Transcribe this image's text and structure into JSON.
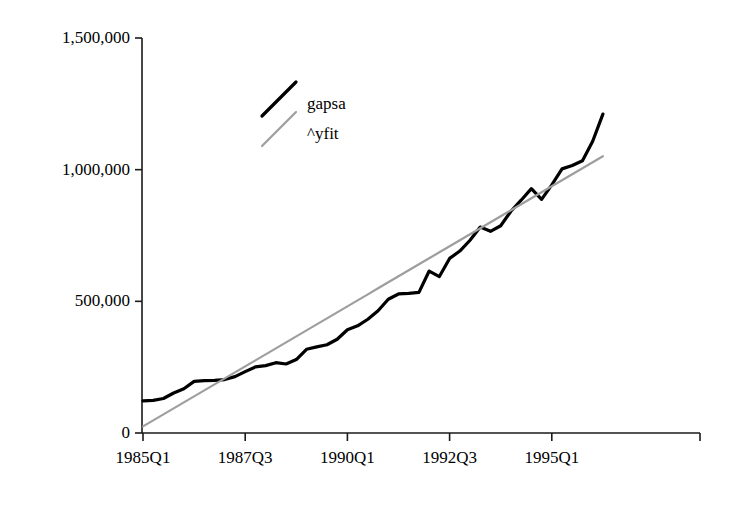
{
  "chart_data": {
    "type": "line",
    "title": "",
    "subtitle": "",
    "xlabel": "",
    "ylabel": "",
    "grid": false,
    "legend_position": "upper-left-inside",
    "xlim": [
      0,
      45
    ],
    "ylim": [
      0,
      1500000
    ],
    "ytick_values": [
      0,
      500000,
      1000000,
      1500000
    ],
    "ytick_labels": [
      "0",
      "500,000",
      "1,000,000",
      "1,500,000"
    ],
    "xtick_values": [
      0,
      10,
      20,
      30,
      40
    ],
    "xtick_labels": [
      "1985Q1",
      "1987Q3",
      "1990Q1",
      "1992Q3",
      "1995Q1"
    ],
    "x_quarters": [
      "1985Q1",
      "1985Q2",
      "1985Q3",
      "1985Q4",
      "1986Q1",
      "1986Q2",
      "1986Q3",
      "1986Q4",
      "1987Q1",
      "1987Q2",
      "1987Q3",
      "1987Q4",
      "1988Q1",
      "1988Q2",
      "1988Q3",
      "1988Q4",
      "1989Q1",
      "1989Q2",
      "1989Q3",
      "1989Q4",
      "1990Q1",
      "1990Q2",
      "1990Q3",
      "1990Q4",
      "1991Q1",
      "1991Q2",
      "1991Q3",
      "1991Q4",
      "1992Q1",
      "1992Q2",
      "1992Q3",
      "1992Q4",
      "1993Q1",
      "1993Q2",
      "1993Q3",
      "1993Q4",
      "1994Q1",
      "1994Q2",
      "1994Q3",
      "1994Q4",
      "1995Q1",
      "1995Q2",
      "1995Q3",
      "1995Q4",
      "1996Q1",
      "1996Q2"
    ],
    "series": [
      {
        "name": "gapsa",
        "color": "#000000",
        "width": 3.2,
        "values": [
          122000,
          124000,
          131000,
          152000,
          168000,
          196000,
          199000,
          200000,
          203000,
          214000,
          233000,
          251000,
          256000,
          267000,
          262000,
          279000,
          318000,
          327000,
          335000,
          356000,
          392000,
          407000,
          432000,
          464000,
          508000,
          528000,
          530000,
          534000,
          615000,
          594000,
          663000,
          691000,
          732000,
          782000,
          766000,
          787000,
          842000,
          884000,
          928000,
          887000,
          942000,
          1003000,
          1016000,
          1034000,
          1108000,
          1211000
        ]
      },
      {
        "name": "^yfit",
        "color": "#9e9e9e",
        "width": 2.2,
        "values": [
          25000,
          47800,
          70600,
          93400,
          116200,
          139000,
          161800,
          184600,
          207400,
          230200,
          253000,
          275800,
          298600,
          321400,
          344200,
          367000,
          389800,
          412600,
          435400,
          458200,
          481000,
          503800,
          526600,
          549400,
          572200,
          595000,
          617800,
          640600,
          663400,
          686200,
          709000,
          731800,
          754600,
          777400,
          800200,
          823000,
          845800,
          868600,
          891400,
          914200,
          937000,
          959800,
          982600,
          1005400,
          1028200,
          1051000
        ]
      }
    ],
    "legend": [
      {
        "label": "gapsa",
        "color": "#000000"
      },
      {
        "label": "^yfit",
        "color": "#9e9e9e"
      }
    ]
  },
  "axes": {
    "axis_color": "#1a1a1a"
  }
}
